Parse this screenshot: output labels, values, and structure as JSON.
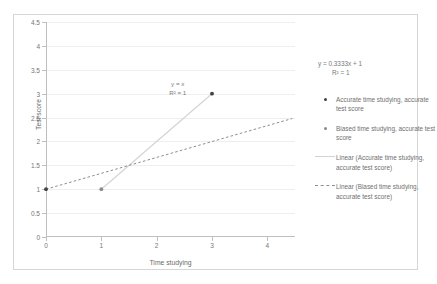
{
  "chart_data": {
    "type": "scatter",
    "title": "",
    "xlabel": "Time studying",
    "ylabel": "Test score",
    "xlim": [
      0,
      4.5
    ],
    "ylim": [
      0,
      4.5
    ],
    "xticks": [
      "0",
      "1",
      "2",
      "3",
      "4"
    ],
    "xtick_values": [
      0,
      1,
      2,
      3,
      4
    ],
    "yticks": [
      "0",
      "0.5",
      "1",
      "1.5",
      "2",
      "2.5",
      "3",
      "3.5",
      "4",
      "4.5"
    ],
    "ytick_values": [
      0,
      0.5,
      1,
      1.5,
      2,
      2.5,
      3,
      3.5,
      4,
      4.5
    ],
    "grid": "horizontal",
    "legend_position": "right",
    "series": [
      {
        "name": "Accurate time studying, accurate test score",
        "marker": "dot",
        "color": "#404040",
        "points": [
          [
            0,
            1
          ],
          [
            3,
            3
          ]
        ]
      },
      {
        "name": "Biased time studying, accurate test score",
        "marker": "dot",
        "color": "#8a8a8a",
        "points": [
          [
            1,
            1
          ]
        ]
      }
    ],
    "trendlines": [
      {
        "name": "Linear (Accurate time studying, accurate test score)",
        "style": "solid",
        "color": "#d3d3d3",
        "equation": "y = x",
        "r2": "R² = 1",
        "from": [
          1,
          1
        ],
        "to": [
          3.02,
          3.02
        ]
      },
      {
        "name": "Linear (Biased time studying, accurate test score)",
        "style": "dashed",
        "color": "#8f8f8f",
        "equation": "y = 0.3333x + 1",
        "r2": "R² = 1",
        "slope": 0.3333,
        "intercept": 1,
        "from": [
          0,
          1
        ],
        "to": [
          4.45,
          2.48
        ]
      }
    ],
    "annotations": [
      {
        "text_line1": "y = x",
        "text_line2": "R² = 1",
        "x": 2.38,
        "y": 3.28
      }
    ]
  },
  "legend": {
    "equation_line1": "y = 0.3333x + 1",
    "equation_line2": "R² = 1",
    "entries": [
      {
        "key": "marker-dark",
        "label": "Accurate time studying, accurate test score"
      },
      {
        "key": "marker-gray",
        "label": "Biased time studying, accurate test score"
      },
      {
        "key": "line-solid",
        "label": "Linear (Accurate time studying, accurate test score)"
      },
      {
        "key": "line-dashed",
        "label": "Linear (Biased time studying, accurate test score)"
      }
    ]
  },
  "colors": {
    "grid": "#ededf2",
    "axis": "#bfbfbf",
    "frame": "#d6d6d6",
    "marker_dark": "#404040",
    "marker_gray": "#8a8a8a",
    "trend_solid": "#d3d3d3",
    "trend_dashed": "#8f8f8f",
    "text": "#6f6f6f"
  }
}
